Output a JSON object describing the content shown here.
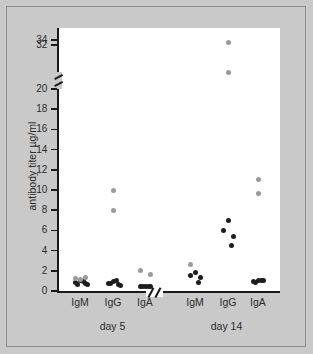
{
  "chart_data": {
    "type": "scatter",
    "title": "",
    "xlabel": "",
    "ylabel": "antibody titer µg/ml",
    "ylim": [
      0,
      35
    ],
    "y_ticks": [
      0,
      2,
      4,
      6,
      8,
      10,
      12,
      14,
      16,
      18,
      20,
      32,
      34
    ],
    "y_tick_labels": [
      "0",
      "2",
      "4",
      "6",
      "8",
      "10",
      "12",
      "14",
      "16",
      "18",
      "20",
      "32",
      "34"
    ],
    "y_axis_break": {
      "present": true,
      "between": [
        20,
        32
      ]
    },
    "x_axis_break": {
      "present": true,
      "between": [
        "day 5",
        "day 14"
      ]
    },
    "grid": false,
    "legend": null,
    "categories": [
      "IgM",
      "IgG",
      "IgA",
      "IgM",
      "IgG",
      "IgA"
    ],
    "groups": [
      {
        "day": "day 5",
        "label": "day 5",
        "series": [
          {
            "name": "IgM",
            "label": "IgM",
            "dark_values": [
              1.0,
              0.8,
              0.7,
              0.9,
              0.65,
              0.6
            ],
            "light_values": [
              1.25,
              1.35,
              1.1
            ]
          },
          {
            "name": "IgG",
            "label": "IgG",
            "dark_values": [
              0.9,
              0.7,
              0.6,
              1.0,
              0.75,
              0.5
            ],
            "light_values": [
              10.0,
              8.0
            ]
          },
          {
            "name": "IgA",
            "label": "IgA",
            "dark_values": [
              0.4,
              0.4,
              0.4,
              0.4,
              0.4
            ],
            "light_values": [
              2.05,
              1.6
            ]
          }
        ]
      },
      {
        "day": "day 14",
        "label": "day 14",
        "series": [
          {
            "name": "IgM",
            "label": "IgM",
            "dark_values": [
              1.8,
              1.55,
              1.35,
              0.8
            ],
            "light_values": [
              2.6
            ]
          },
          {
            "name": "IgG",
            "label": "IgG",
            "dark_values": [
              7.0,
              6.0,
              5.4,
              4.5
            ],
            "light_values": [
              33.0,
              21.0
            ]
          },
          {
            "name": "IgA",
            "label": "IgA",
            "dark_values": [
              1.0,
              0.9,
              1.0,
              1.05,
              0.85
            ],
            "light_values": [
              11.0,
              9.7
            ]
          }
        ]
      }
    ],
    "colors": {
      "dark_marker": "#1d1d1d",
      "light_marker": "#9a9a9a",
      "axis": "#1a1a1a",
      "plot_background": "#ffffff",
      "page_background": "#c9c9c9"
    }
  }
}
